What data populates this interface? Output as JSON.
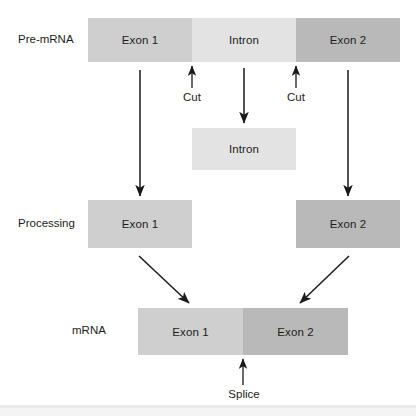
{
  "diagram": {
    "colors": {
      "exon1": "#cfcfcf",
      "intron": "#e3e3e3",
      "exon2": "#b9b9b9",
      "arrow": "#1a1a1a",
      "background": "#ffffff",
      "text": "#1c1c1c"
    },
    "rows": [
      {
        "id": "pre-mrna",
        "label": "Pre-mRNA"
      },
      {
        "id": "processing",
        "label": "Processing"
      },
      {
        "id": "mrna",
        "label": "mRNA"
      }
    ],
    "pre_mrna": {
      "segments": [
        {
          "id": "exon1",
          "label": "Exon 1"
        },
        {
          "id": "intron",
          "label": "Intron"
        },
        {
          "id": "exon2",
          "label": "Exon 2"
        }
      ]
    },
    "released_intron": {
      "label": "Intron"
    },
    "processing": {
      "segments": [
        {
          "id": "exon1",
          "label": "Exon 1"
        },
        {
          "id": "exon2",
          "label": "Exon 2"
        }
      ]
    },
    "mrna": {
      "segments": [
        {
          "id": "exon1",
          "label": "Exon 1"
        },
        {
          "id": "exon2",
          "label": "Exon 2"
        }
      ]
    },
    "annotations": {
      "cut_left": "Cut",
      "cut_right": "Cut",
      "splice": "Splice"
    }
  }
}
